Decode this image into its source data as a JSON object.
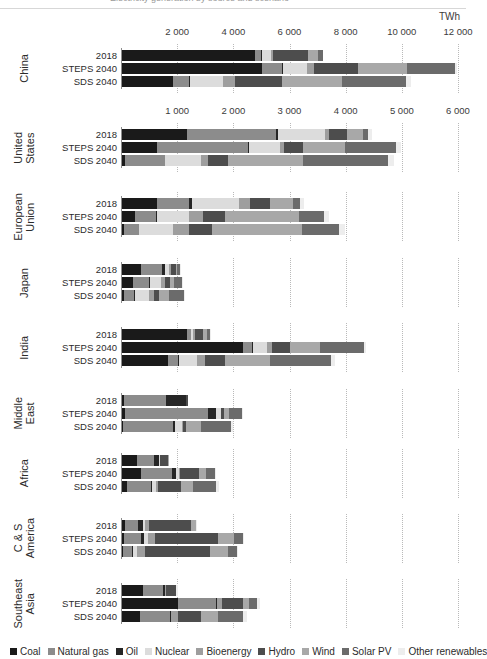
{
  "title_partial": "Electricity generation by source and scenario",
  "unit_label": "TWh",
  "legend": [
    {
      "label": "Coal",
      "color": "#1a1a1a"
    },
    {
      "label": "Natural gas",
      "color": "#8c8c8c"
    },
    {
      "label": "Oil",
      "color": "#262626"
    },
    {
      "label": "Nuclear",
      "color": "#dcdcdc"
    },
    {
      "label": "Bioenergy",
      "color": "#9e9e9e"
    },
    {
      "label": "Hydro",
      "color": "#4d4d4d"
    },
    {
      "label": "Wind",
      "color": "#a8a8a8"
    },
    {
      "label": "Solar PV",
      "color": "#6b6b6b"
    },
    {
      "label": "Other renewables",
      "color": "#ededed"
    }
  ],
  "scenarios": [
    "2018",
    "STEPS 2040",
    "SDS 2040"
  ],
  "axes": [
    {
      "id": "china",
      "max": 12000,
      "ticks": [
        "2 000",
        "4 000",
        "6 000",
        "8 000",
        "10 000",
        "12 000"
      ],
      "tick_values": [
        2000,
        4000,
        6000,
        8000,
        10000,
        12000
      ]
    },
    {
      "id": "others",
      "max": 6000,
      "ticks": [
        "1 000",
        "2 000",
        "3 000",
        "4 000",
        "5 000",
        "6 000"
      ],
      "tick_values": [
        1000,
        2000,
        3000,
        4000,
        5000,
        6000
      ]
    }
  ],
  "chart_data": {
    "type": "bar",
    "orientation": "horizontal",
    "stacked": true,
    "title": "Electricity generation by source and scenario",
    "xlabel": "TWh",
    "ylabel": "",
    "grid": true,
    "legend_position": "bottom",
    "series_names": [
      "Coal",
      "Natural gas",
      "Oil",
      "Nuclear",
      "Bioenergy",
      "Hydro",
      "Wind",
      "Solar PV",
      "Other renewables"
    ],
    "axis_note": "China panel uses 0-12 000 TWh scale; all other regions use 0-6 000 TWh scale",
    "groups": [
      {
        "region": "China",
        "axis": "china",
        "bars": [
          {
            "scenario": "2018",
            "total": 7150,
            "values": {
              "Coal": 4740,
              "Natural gas": 220,
              "Oil": 40,
              "Nuclear": 295,
              "Bioenergy": 95,
              "Hydro": 1230,
              "Wind": 370,
              "Solar PV": 180,
              "Other renewables": 20
            }
          },
          {
            "scenario": "STEPS 2040",
            "total": 11920,
            "values": {
              "Coal": 5000,
              "Natural gas": 700,
              "Oil": 30,
              "Nuclear": 850,
              "Bioenergy": 270,
              "Hydro": 1550,
              "Wind": 1750,
              "Solar PV": 1700,
              "Other renewables": 70
            }
          },
          {
            "scenario": "SDS 2040",
            "total": 10290,
            "values": {
              "Coal": 1830,
              "Natural gas": 570,
              "Oil": 10,
              "Nuclear": 1180,
              "Bioenergy": 420,
              "Hydro": 1680,
              "Wind": 2150,
              "Solar PV": 2280,
              "Other renewables": 170
            }
          }
        ]
      },
      {
        "region": "United States",
        "axis": "others",
        "bars": [
          {
            "scenario": "2018",
            "total": 4450,
            "values": {
              "Coal": 1150,
              "Natural gas": 1600,
              "Oil": 30,
              "Nuclear": 840,
              "Bioenergy": 70,
              "Hydro": 320,
              "Wind": 280,
              "Solar PV": 90,
              "Other renewables": 70
            }
          },
          {
            "scenario": "STEPS 2040",
            "total": 4970,
            "values": {
              "Coal": 620,
              "Natural gas": 1620,
              "Oil": 20,
              "Nuclear": 560,
              "Bioenergy": 70,
              "Hydro": 330,
              "Wind": 760,
              "Solar PV": 900,
              "Other renewables": 90
            }
          },
          {
            "scenario": "SDS 2040",
            "total": 4840,
            "values": {
              "Coal": 60,
              "Natural gas": 700,
              "Oil": 10,
              "Nuclear": 630,
              "Bioenergy": 130,
              "Hydro": 350,
              "Wind": 1350,
              "Solar PV": 1500,
              "Other renewables": 110
            }
          }
        ]
      },
      {
        "region": "European Union",
        "axis": "others",
        "bars": [
          {
            "scenario": "2018",
            "total": 3250,
            "values": {
              "Coal": 620,
              "Natural gas": 570,
              "Oil": 60,
              "Nuclear": 830,
              "Bioenergy": 200,
              "Hydro": 360,
              "Wind": 400,
              "Solar PV": 125,
              "Other renewables": 85
            }
          },
          {
            "scenario": "STEPS 2040",
            "total": 3690,
            "values": {
              "Coal": 230,
              "Natural gas": 380,
              "Oil": 10,
              "Nuclear": 570,
              "Bioenergy": 260,
              "Hydro": 390,
              "Wind": 1320,
              "Solar PV": 440,
              "Other renewables": 90
            }
          },
          {
            "scenario": "SDS 2040",
            "total": 3970,
            "values": {
              "Coal": 40,
              "Natural gas": 260,
              "Oil": 10,
              "Nuclear": 600,
              "Bioenergy": 290,
              "Hydro": 400,
              "Wind": 1600,
              "Solar PV": 660,
              "Other renewables": 110
            }
          }
        ]
      },
      {
        "region": "Japan",
        "axis": "others",
        "bars": [
          {
            "scenario": "2018",
            "total": 1050,
            "values": {
              "Coal": 330,
              "Natural gas": 390,
              "Oil": 50,
              "Nuclear": 65,
              "Bioenergy": 45,
              "Hydro": 85,
              "Wind": 8,
              "Solar PV": 65,
              "Other renewables": 12
            }
          },
          {
            "scenario": "STEPS 2040",
            "total": 1080,
            "values": {
              "Coal": 200,
              "Natural gas": 280,
              "Oil": 15,
              "Nuclear": 200,
              "Bioenergy": 70,
              "Hydro": 95,
              "Wind": 70,
              "Solar PV": 135,
              "Other renewables": 15
            }
          },
          {
            "scenario": "SDS 2040",
            "total": 1130,
            "values": {
              "Coal": 40,
              "Natural gas": 180,
              "Oil": 5,
              "Nuclear": 250,
              "Bioenergy": 90,
              "Hydro": 100,
              "Wind": 170,
              "Solar PV": 270,
              "Other renewables": 25
            }
          }
        ]
      },
      {
        "region": "India",
        "axis": "others",
        "bars": [
          {
            "scenario": "2018",
            "total": 1580,
            "values": {
              "Coal": 1150,
              "Natural gas": 70,
              "Oil": 10,
              "Nuclear": 40,
              "Bioenergy": 30,
              "Hydro": 150,
              "Wind": 60,
              "Solar PV": 60,
              "Other renewables": 10
            }
          },
          {
            "scenario": "STEPS 2040",
            "total": 4350,
            "values": {
              "Coal": 2160,
              "Natural gas": 160,
              "Oil": 10,
              "Nuclear": 250,
              "Bioenergy": 90,
              "Hydro": 330,
              "Wind": 530,
              "Solar PV": 780,
              "Other renewables": 40
            }
          },
          {
            "scenario": "SDS 2040",
            "total": 3800,
            "values": {
              "Coal": 820,
              "Natural gas": 180,
              "Oil": 10,
              "Nuclear": 330,
              "Bioenergy": 130,
              "Hydro": 360,
              "Wind": 800,
              "Solar PV": 1100,
              "Other renewables": 70
            }
          }
        ]
      },
      {
        "region": "Middle East",
        "axis": "others",
        "bars": [
          {
            "scenario": "2018",
            "total": 1180,
            "values": {
              "Coal": 40,
              "Natural gas": 750,
              "Oil": 350,
              "Nuclear": 5,
              "Bioenergy": 3,
              "Hydro": 30,
              "Wind": 1,
              "Solar PV": 1,
              "Other renewables": 0
            }
          },
          {
            "scenario": "STEPS 2040",
            "total": 2150,
            "values": {
              "Coal": 60,
              "Natural gas": 1480,
              "Oil": 130,
              "Nuclear": 90,
              "Bioenergy": 10,
              "Hydro": 50,
              "Wind": 90,
              "Solar PV": 230,
              "Other renewables": 10
            }
          },
          {
            "scenario": "SDS 2040",
            "total": 1970,
            "values": {
              "Coal": 20,
              "Natural gas": 890,
              "Oil": 40,
              "Nuclear": 110,
              "Bioenergy": 20,
              "Hydro": 60,
              "Wind": 260,
              "Solar PV": 540,
              "Other renewables": 30
            }
          }
        ]
      },
      {
        "region": "Africa",
        "axis": "others",
        "bars": [
          {
            "scenario": "2018",
            "total": 840,
            "values": {
              "Coal": 260,
              "Natural gas": 310,
              "Oil": 90,
              "Nuclear": 15,
              "Bioenergy": 5,
              "Hydro": 140,
              "Wind": 10,
              "Solar PV": 10,
              "Other renewables": 5
            }
          },
          {
            "scenario": "STEPS 2040",
            "total": 1680,
            "values": {
              "Coal": 330,
              "Natural gas": 560,
              "Oil": 70,
              "Nuclear": 60,
              "Bioenergy": 20,
              "Hydro": 330,
              "Wind": 130,
              "Solar PV": 160,
              "Other renewables": 30
            }
          },
          {
            "scenario": "SDS 2040",
            "total": 1720,
            "values": {
              "Coal": 90,
              "Natural gas": 420,
              "Oil": 30,
              "Nuclear": 70,
              "Bioenergy": 40,
              "Hydro": 400,
              "Wind": 220,
              "Solar PV": 400,
              "Other renewables": 50
            }
          }
        ]
      },
      {
        "region": "C & S America",
        "axis": "others",
        "bars": [
          {
            "scenario": "2018",
            "total": 1330,
            "values": {
              "Coal": 50,
              "Natural gas": 240,
              "Oil": 90,
              "Nuclear": 30,
              "Bioenergy": 70,
              "Hydro": 750,
              "Wind": 80,
              "Solar PV": 15,
              "Other renewables": 5
            }
          },
          {
            "scenario": "STEPS 2040",
            "total": 2180,
            "values": {
              "Coal": 40,
              "Natural gas": 300,
              "Oil": 60,
              "Nuclear": 60,
              "Bioenergy": 130,
              "Hydro": 1120,
              "Wind": 290,
              "Solar PV": 160,
              "Other renewables": 20
            }
          },
          {
            "scenario": "SDS 2040",
            "total": 2060,
            "values": {
              "Coal": 10,
              "Natural gas": 160,
              "Oil": 20,
              "Nuclear": 70,
              "Bioenergy": 150,
              "Hydro": 1150,
              "Wind": 330,
              "Solar PV": 150,
              "Other renewables": 20
            }
          }
        ]
      },
      {
        "region": "Southeast Asia",
        "axis": "others",
        "bars": [
          {
            "scenario": "2018",
            "total": 1000,
            "values": {
              "Coal": 380,
              "Natural gas": 350,
              "Oil": 30,
              "Nuclear": 0,
              "Bioenergy": 30,
              "Hydro": 170,
              "Wind": 5,
              "Solar PV": 5,
              "Other renewables": 30
            }
          },
          {
            "scenario": "STEPS 2040",
            "total": 2450,
            "values": {
              "Coal": 1000,
              "Natural gas": 680,
              "Oil": 20,
              "Nuclear": 0,
              "Bioenergy": 80,
              "Hydro": 370,
              "Wind": 110,
              "Solar PV": 150,
              "Other renewables": 40
            }
          },
          {
            "scenario": "SDS 2040",
            "total": 2230,
            "values": {
              "Coal": 320,
              "Natural gas": 540,
              "Oil": 10,
              "Nuclear": 0,
              "Bioenergy": 120,
              "Hydro": 420,
              "Wind": 300,
              "Solar PV": 440,
              "Other renewables": 80
            }
          }
        ]
      }
    ]
  }
}
